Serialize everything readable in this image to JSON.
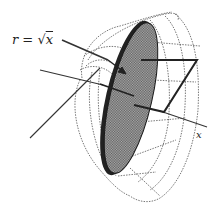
{
  "diagram": {
    "labels": {
      "radius_lhs": "r",
      "equals": " = ",
      "sqrt_symbol": "√",
      "radius_rhs": "x",
      "axis": "x"
    },
    "colors": {
      "disk_fill": "#8e8e8e",
      "disk_edge": "#1a1a1a",
      "wireframe": "#555555",
      "lines": "#333333",
      "background": "#ffffff"
    }
  }
}
